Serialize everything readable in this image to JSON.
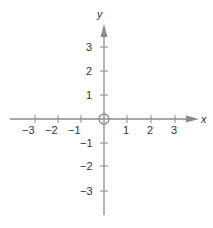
{
  "diagram": {
    "type": "cartesian-coordinate-plane",
    "x_axis": {
      "label": "x",
      "ticks": [
        -3,
        -2,
        -1,
        1,
        2,
        3
      ],
      "tick_labels": [
        "−3",
        "−2",
        "−1",
        "1",
        "2",
        "3"
      ]
    },
    "y_axis": {
      "label": "y",
      "ticks": [
        3,
        2,
        1,
        -1,
        -2,
        -3
      ],
      "tick_labels": [
        "3",
        "2",
        "1",
        "−1",
        "−2",
        "−3"
      ]
    },
    "origin_marker": "circle",
    "colors": {
      "axis": "#8a8a8a",
      "text": "#333333"
    }
  }
}
